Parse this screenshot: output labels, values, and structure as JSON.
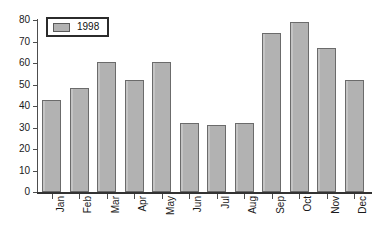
{
  "chart_data": {
    "type": "bar",
    "title": "",
    "xlabel": "",
    "ylabel": "",
    "ylim": [
      0,
      80
    ],
    "yticks": [
      0,
      10,
      20,
      30,
      40,
      50,
      60,
      70,
      80
    ],
    "grid": false,
    "legend_position": "top-left",
    "categories": [
      "Jan",
      "Feb",
      "Mar",
      "Apr",
      "May",
      "Jun",
      "Jul",
      "Aug",
      "Sep",
      "Oct",
      "Nov",
      "Dec"
    ],
    "series": [
      {
        "name": "1998",
        "values": [
          43,
          48.5,
          60.5,
          52.3,
          60.5,
          32,
          31.3,
          32.2,
          74,
          79,
          67.2,
          52
        ]
      }
    ]
  },
  "legend": {
    "entries": [
      {
        "label": "1998",
        "swatch_name": "legend-swatch-1998"
      }
    ]
  },
  "colors": {
    "bar_fill": "#b2b2b2",
    "bar_stroke": "#6b6b6b",
    "axis": "#4d4d4d",
    "axis_baseline": "#333333",
    "text": "#1a1a1a",
    "background": "#ffffff",
    "legend_border": "#2b2b2b"
  }
}
